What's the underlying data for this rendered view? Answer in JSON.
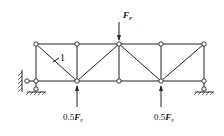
{
  "diagram": {
    "type": "truss",
    "member_label": "1",
    "top_load": {
      "label_main": "F",
      "label_sub": "P"
    },
    "bottom_loads": [
      {
        "label_coef": "0.5",
        "label_main": "F",
        "label_sub": "P"
      },
      {
        "label_coef": "0.5",
        "label_main": "F",
        "label_sub": "P"
      }
    ],
    "nodes_top_x": [
      36,
      77,
      119,
      161,
      204
    ],
    "top_y": 44,
    "bottom_y": 81
  }
}
